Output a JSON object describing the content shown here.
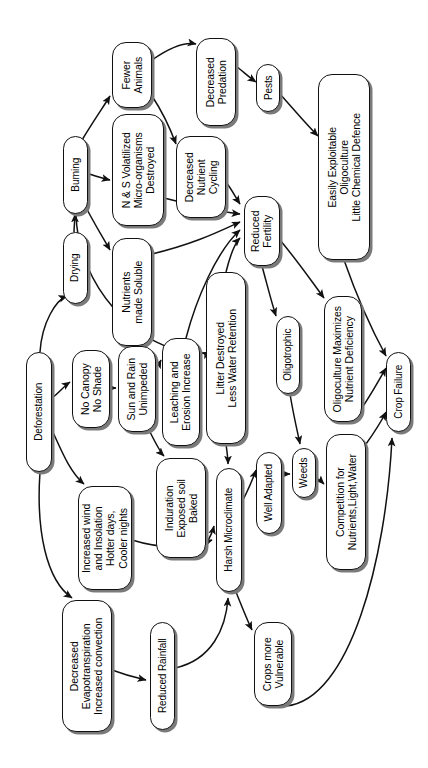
{
  "figure": {
    "type": "flowchart",
    "orientation": "rotated-90-ccw",
    "caption": ""
  },
  "nodes": [
    {
      "id": "deforestation",
      "label": "Deforestation",
      "x": 26,
      "y": 352,
      "w": 26,
      "h": 120
    },
    {
      "id": "drying",
      "label": "Drying",
      "x": 63,
      "y": 232,
      "w": 25,
      "h": 72
    },
    {
      "id": "burning",
      "label": "Burning",
      "x": 63,
      "y": 136,
      "w": 25,
      "h": 78
    },
    {
      "id": "fewer-animals",
      "label": "Fewer\nAnimals",
      "x": 112,
      "y": 42,
      "w": 40,
      "h": 66
    },
    {
      "id": "ns-volatilized",
      "label": "N & S Volatilized\nMicro-organisms\nDestroyed",
      "x": 112,
      "y": 114,
      "w": 52,
      "h": 112
    },
    {
      "id": "nutrients-soluble",
      "label": "Nutrients\nmade Soluble",
      "x": 112,
      "y": 238,
      "w": 40,
      "h": 108
    },
    {
      "id": "decreased-predation",
      "label": "Decreased\nPredation",
      "x": 196,
      "y": 38,
      "w": 40,
      "h": 88
    },
    {
      "id": "pests",
      "label": "Pests",
      "x": 256,
      "y": 64,
      "w": 24,
      "h": 48
    },
    {
      "id": "decreased-nutrient-cycling",
      "label": "Decreased\nNutrient\nCycling",
      "x": 176,
      "y": 136,
      "w": 50,
      "h": 82
    },
    {
      "id": "easily-exploitable",
      "label": "Easily Exploitable\nOligoculture\nLittle Chemical Defence",
      "x": 318,
      "y": 74,
      "w": 52,
      "h": 186
    },
    {
      "id": "reduced-fertility",
      "label": "Reduced\nFertility",
      "x": 244,
      "y": 196,
      "w": 36,
      "h": 70
    },
    {
      "id": "litter-destroyed",
      "label": "Litter Destroyed\nLess Water Retention",
      "x": 206,
      "y": 272,
      "w": 40,
      "h": 172
    },
    {
      "id": "leaching-erosion",
      "label": "Leaching and\nErosion Increase",
      "x": 162,
      "y": 338,
      "w": 38,
      "h": 108
    },
    {
      "id": "no-canopy",
      "label": "No Canopy\nNo Shade",
      "x": 72,
      "y": 350,
      "w": 38,
      "h": 78
    },
    {
      "id": "sun-rain",
      "label": "Sun and Rain\nUnimpeded",
      "x": 118,
      "y": 346,
      "w": 38,
      "h": 86
    },
    {
      "id": "induration",
      "label": "Induration\nExposed soil\nBaked",
      "x": 156,
      "y": 458,
      "w": 50,
      "h": 100
    },
    {
      "id": "oligotrophic",
      "label": "Oligotrophic",
      "x": 276,
      "y": 316,
      "w": 24,
      "h": 78
    },
    {
      "id": "oligoculture-maximizes",
      "label": "Oligoculture Maximizes\nNutrient Deficiency",
      "x": 324,
      "y": 296,
      "w": 38,
      "h": 126
    },
    {
      "id": "increased-wind",
      "label": "Increased wind\nand Insolation\nHotter days,\nCooler nights",
      "x": 78,
      "y": 486,
      "w": 54,
      "h": 104
    },
    {
      "id": "harsh-microclimate",
      "label": "Harsh Microclimate",
      "x": 216,
      "y": 468,
      "w": 26,
      "h": 124
    },
    {
      "id": "well-adapted",
      "label": "Well Adapted",
      "x": 256,
      "y": 452,
      "w": 26,
      "h": 82
    },
    {
      "id": "weeds",
      "label": "Weeds",
      "x": 292,
      "y": 448,
      "w": 24,
      "h": 50
    },
    {
      "id": "competition",
      "label": "Competition for\nNutrients,Light,Water",
      "x": 326,
      "y": 434,
      "w": 40,
      "h": 136
    },
    {
      "id": "crop-failure",
      "label": "Crop Failure",
      "x": 386,
      "y": 352,
      "w": 25,
      "h": 80
    },
    {
      "id": "decreased-evapo",
      "label": "Decreased\nEvapotranspiration\nIncreased convection",
      "x": 62,
      "y": 600,
      "w": 50,
      "h": 132
    },
    {
      "id": "reduced-rainfall",
      "label": "Reduced Rainfall",
      "x": 150,
      "y": 622,
      "w": 25,
      "h": 108
    },
    {
      "id": "crops-vulnerable",
      "label": "Crops more\nVulnerable",
      "x": 254,
      "y": 622,
      "w": 38,
      "h": 84
    }
  ],
  "edges": [
    {
      "from": "deforestation",
      "to": "drying"
    },
    {
      "from": "deforestation",
      "to": "no-canopy"
    },
    {
      "from": "deforestation",
      "to": "increased-wind"
    },
    {
      "from": "deforestation",
      "to": "decreased-evapo"
    },
    {
      "from": "drying",
      "to": "burning"
    },
    {
      "from": "burning",
      "to": "fewer-animals"
    },
    {
      "from": "burning",
      "to": "ns-volatilized"
    },
    {
      "from": "burning",
      "to": "nutrients-soluble"
    },
    {
      "from": "burning",
      "to": "litter-destroyed"
    },
    {
      "from": "fewer-animals",
      "to": "decreased-predation"
    },
    {
      "from": "fewer-animals",
      "to": "decreased-nutrient-cycling"
    },
    {
      "from": "decreased-predation",
      "to": "pests"
    },
    {
      "from": "pests",
      "to": "easily-exploitable"
    },
    {
      "from": "ns-volatilized",
      "to": "reduced-fertility"
    },
    {
      "from": "decreased-nutrient-cycling",
      "to": "reduced-fertility"
    },
    {
      "from": "nutrients-soluble",
      "to": "reduced-fertility"
    },
    {
      "from": "leaching-erosion",
      "to": "reduced-fertility"
    },
    {
      "from": "litter-destroyed",
      "to": "reduced-fertility"
    },
    {
      "from": "reduced-fertility",
      "to": "oligotrophic"
    },
    {
      "from": "reduced-fertility",
      "to": "oligoculture-maximizes"
    },
    {
      "from": "oligotrophic",
      "to": "weeds"
    },
    {
      "from": "easily-exploitable",
      "to": "crop-failure"
    },
    {
      "from": "oligoculture-maximizes",
      "to": "crop-failure"
    },
    {
      "from": "no-canopy",
      "to": "sun-rain"
    },
    {
      "from": "sun-rain",
      "to": "leaching-erosion"
    },
    {
      "from": "sun-rain",
      "to": "induration"
    },
    {
      "from": "litter-destroyed",
      "to": "harsh-microclimate"
    },
    {
      "from": "induration",
      "to": "harsh-microclimate"
    },
    {
      "from": "increased-wind",
      "to": "harsh-microclimate"
    },
    {
      "from": "harsh-microclimate",
      "to": "well-adapted"
    },
    {
      "from": "well-adapted",
      "to": "weeds"
    },
    {
      "from": "weeds",
      "to": "competition"
    },
    {
      "from": "competition",
      "to": "crop-failure"
    },
    {
      "from": "decreased-evapo",
      "to": "reduced-rainfall"
    },
    {
      "from": "reduced-rainfall",
      "to": "harsh-microclimate"
    },
    {
      "from": "harsh-microclimate",
      "to": "crops-vulnerable"
    },
    {
      "from": "crops-vulnerable",
      "to": "crop-failure"
    }
  ]
}
